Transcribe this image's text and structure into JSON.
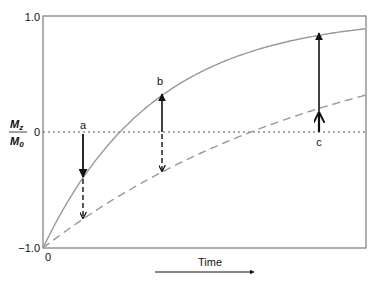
{
  "figure": {
    "y_axis": {
      "label_numerator": "M",
      "label_numerator_sub": "z",
      "label_denominator": "M",
      "label_denominator_sub": "0",
      "ticks": [
        "1.0",
        "0",
        "−1.0"
      ]
    },
    "x_axis": {
      "origin_label": "0",
      "label": "Time"
    },
    "markers": [
      {
        "label": "a"
      },
      {
        "label": "b"
      },
      {
        "label": "c"
      }
    ],
    "colors": {
      "frame": "#7a7a7a",
      "curve": "#999999",
      "arrow": "#111111",
      "zero_line": "#555555"
    }
  },
  "chart_data": {
    "type": "line",
    "title": "",
    "xlabel": "Time",
    "ylabel": "Mz/M0",
    "ylim": [
      -1.0,
      1.0
    ],
    "y_ticks": [
      1.0,
      0,
      -1.0
    ],
    "x_origin": 0,
    "series": [
      {
        "name": "solid recovery curve (short T1)",
        "style": "solid",
        "formula": "1 - 2*exp(-t/0.345)",
        "start": -1.0,
        "end": 0.88
      },
      {
        "name": "dashed recovery curve (long T1)",
        "style": "dashed",
        "formula": "1 - 2*exp(-t/0.93)",
        "start": -1.0,
        "end": 0.32
      }
    ],
    "annotations": [
      {
        "label": "a",
        "x_frac": 0.124,
        "solid_value": -0.39,
        "dashed_value": -0.75,
        "description": "both below zero; arrows point down"
      },
      {
        "label": "b",
        "x_frac": 0.368,
        "solid_value": 0.32,
        "dashed_value": -0.35,
        "description": "solid above zero (up arrow), dashed below (down arrow)"
      },
      {
        "label": "c",
        "x_frac": 0.854,
        "solid_value": 0.86,
        "dashed_value": 0.18,
        "description": "both above zero; arrows point up"
      }
    ],
    "grid": false,
    "reference_lines": [
      {
        "y": 0,
        "style": "dotted"
      }
    ]
  }
}
